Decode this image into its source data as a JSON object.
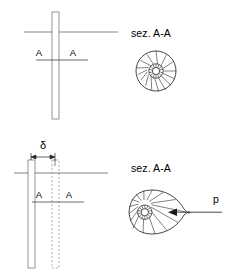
{
  "figure": {
    "panels": [
      {
        "id": "undeformed",
        "section_label": "sez. A-A",
        "section_marker_left": "A",
        "section_marker_right": "A",
        "state": "undeformed",
        "section_shape": "circle-radial",
        "spoke_count": 14
      },
      {
        "id": "deformed",
        "section_label": "sez. A-A",
        "section_marker_left": "A",
        "section_marker_right": "A",
        "displacement_label": "δ",
        "load_label": "p",
        "state": "displaced",
        "section_shape": "teardrop-radial",
        "spoke_count": 14
      }
    ]
  },
  "labels": {
    "sez_top": "sez. A-A",
    "sez_bottom": "sez. A-A",
    "A_top_left": "A",
    "A_top_right": "A",
    "A_bottom_left": "A",
    "A_bottom_right": "A",
    "delta": "δ",
    "p": "p"
  },
  "colors": {
    "line": "#1a1a1a",
    "bar": "#7a7a7a",
    "dashed_bar": "#8d8d8d",
    "ground": "#4a4a4a",
    "background": "#ffffff"
  },
  "geometry": {
    "top_bar_x": 52,
    "top_bar_width": 7,
    "top_bar_y": 12,
    "top_bar_height": 107,
    "top_ground_y": 32,
    "top_section_y": 60,
    "bottom_bar_x": 28,
    "bottom_bar_width": 7,
    "bottom_bar_y": 160,
    "bottom_bar_height": 108,
    "bottom_dash_x": 52,
    "bottom_ground_y": 173,
    "bottom_section_y": 202,
    "delta_dim_y": 157,
    "circle_cx": 156,
    "circle_cy": 71,
    "circle_r": 20,
    "teardrop_cx": 152,
    "teardrop_cy": 212,
    "p_arrow_x_start": 222,
    "p_arrow_x_end": 168
  }
}
